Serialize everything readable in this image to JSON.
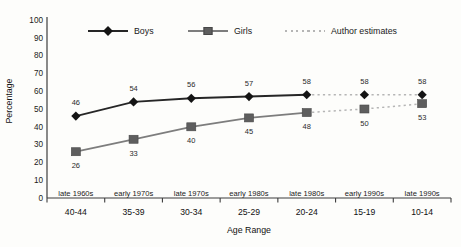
{
  "chart_data": {
    "type": "line",
    "title": "",
    "xlabel": "Age Range",
    "ylabel": "Percentage",
    "ylim": [
      0,
      100
    ],
    "yticks": [
      0,
      10,
      20,
      30,
      40,
      50,
      60,
      70,
      80,
      90,
      100
    ],
    "grid": false,
    "legend_position": "top",
    "categories": [
      "40-44",
      "35-39",
      "30-34",
      "25-29",
      "20-24",
      "15-19",
      "10-14"
    ],
    "period_labels": [
      "late 1960s",
      "early 1970s",
      "late 1970s",
      "early 1980s",
      "late 1980s",
      "early 1990s",
      "late 1990s"
    ],
    "series": [
      {
        "name": "Boys",
        "marker": "diamond",
        "color": "#262626",
        "marker_color": "#141414",
        "values": [
          46,
          54,
          56,
          57,
          58,
          58,
          58
        ],
        "label_position": "above"
      },
      {
        "name": "Girls",
        "marker": "square",
        "color": "#7d7d7d",
        "marker_color": "#5e5e5e",
        "values": [
          26,
          33,
          40,
          45,
          48,
          50,
          53
        ],
        "label_position": "below"
      }
    ],
    "estimates": {
      "label": "Author estimates",
      "color": "#b5b5b5",
      "style": "dashed",
      "start_index": 4
    }
  },
  "colors": {
    "background": "#fdfdfb",
    "axis": "#3d3d3d",
    "text": "#1a1a1a"
  }
}
